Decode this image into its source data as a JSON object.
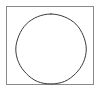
{
  "figure": {
    "name": "circle-inscribed-in-square",
    "description": "A thin dark circle drawn inside a light gray rectangular frame",
    "canvas": {
      "width": 101,
      "height": 92,
      "background_color": "#ffffff"
    },
    "shapes": {
      "frame": {
        "label": "rectangle-frame",
        "type": "rectangle",
        "x": 6,
        "y": 6,
        "width": 88,
        "height": 79,
        "stroke_color": "#8a8a8a",
        "stroke_width": 1,
        "fill": "none"
      },
      "circle": {
        "label": "inscribed-circle",
        "type": "circle",
        "center_x": 51,
        "center_y": 49,
        "radius": 35,
        "stroke_color": "#3b3b3b",
        "stroke_width": 1,
        "fill": "none"
      }
    }
  }
}
